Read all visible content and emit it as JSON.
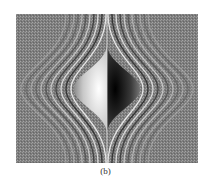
{
  "figure": {
    "panel_label": "(b)",
    "colors": {
      "background": "#7f7f7f",
      "bright": "#ffffff",
      "dark": "#000000"
    }
  }
}
